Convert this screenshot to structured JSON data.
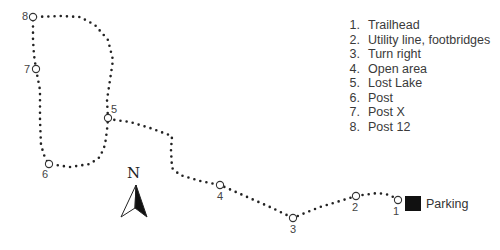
{
  "map": {
    "type": "trail-map",
    "path_points": [
      [
        398,
        200
      ],
      [
        390,
        195
      ],
      [
        378,
        193
      ],
      [
        370,
        194
      ],
      [
        356,
        196
      ],
      [
        340,
        201
      ],
      [
        320,
        207
      ],
      [
        305,
        213
      ],
      [
        293,
        218
      ],
      [
        270,
        207
      ],
      [
        245,
        196
      ],
      [
        220,
        185
      ],
      [
        200,
        181
      ],
      [
        180,
        175
      ],
      [
        172,
        168
      ],
      [
        171,
        150
      ],
      [
        172,
        136
      ],
      [
        150,
        128
      ],
      [
        130,
        122
      ],
      [
        108,
        119
      ],
      [
        107,
        100
      ],
      [
        110,
        80
      ],
      [
        113,
        60
      ],
      [
        108,
        40
      ],
      [
        95,
        25
      ],
      [
        80,
        17
      ],
      [
        60,
        16
      ],
      [
        33,
        17
      ],
      [
        33,
        40
      ],
      [
        34,
        55
      ],
      [
        36,
        69
      ],
      [
        40,
        90
      ],
      [
        40,
        120
      ],
      [
        41,
        145
      ],
      [
        45,
        158
      ],
      [
        49,
        164
      ],
      [
        70,
        167
      ],
      [
        90,
        164
      ],
      [
        100,
        157
      ],
      [
        105,
        145
      ],
      [
        107,
        130
      ],
      [
        108,
        119
      ]
    ],
    "nodes": [
      {
        "id": "1",
        "x": 398,
        "y": 200,
        "label_dx": -5,
        "label_dy": 6
      },
      {
        "id": "2",
        "x": 356,
        "y": 196,
        "label_dx": -4,
        "label_dy": 6
      },
      {
        "id": "3",
        "x": 293,
        "y": 218,
        "label_dx": -3,
        "label_dy": 6
      },
      {
        "id": "4",
        "x": 220,
        "y": 185,
        "label_dx": -3,
        "label_dy": 6
      },
      {
        "id": "5",
        "x": 108,
        "y": 118,
        "label_dx": 3,
        "label_dy": -14
      },
      {
        "id": "6",
        "x": 49,
        "y": 164,
        "label_dx": -7,
        "label_dy": 5
      },
      {
        "id": "7",
        "x": 36,
        "y": 69,
        "label_dx": -12,
        "label_dy": -5
      },
      {
        "id": "8",
        "x": 33,
        "y": 17,
        "label_dx": -11,
        "label_dy": -6
      }
    ],
    "north_label": "N",
    "parking_label": "Parking"
  },
  "legend": [
    {
      "num": "1.",
      "label": "Trailhead"
    },
    {
      "num": "2.",
      "label": "Utility line, footbridges"
    },
    {
      "num": "3.",
      "label": "Turn right"
    },
    {
      "num": "4.",
      "label": "Open area"
    },
    {
      "num": "5.",
      "label": "Lost Lake"
    },
    {
      "num": "6.",
      "label": "Post"
    },
    {
      "num": "7.",
      "label": "Post X"
    },
    {
      "num": "8.",
      "label": "Post 12"
    }
  ],
  "colors": {
    "trail": "#222222",
    "parking": "#111111",
    "text": "#3a3a3a"
  }
}
